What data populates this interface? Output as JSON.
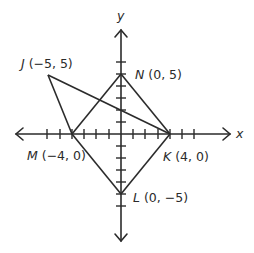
{
  "diagram": {
    "type": "coordinate-plane",
    "colors": {
      "line": "#2b2b2b",
      "background": "#ffffff"
    },
    "axes": {
      "x_label": "x",
      "y_label": "y",
      "tick_spacing_units": 1,
      "x_range": [
        -8,
        8
      ],
      "y_range": [
        -8,
        8
      ]
    },
    "points": [
      {
        "name": "J",
        "coords": "(−5, 5)",
        "x": -5,
        "y": 5
      },
      {
        "name": "N",
        "coords": "(0, 5)",
        "x": 0,
        "y": 5
      },
      {
        "name": "M",
        "coords": "(−4, 0)",
        "x": -4,
        "y": 0
      },
      {
        "name": "K",
        "coords": "(4, 0)",
        "x": 4,
        "y": 0
      },
      {
        "name": "L",
        "coords": "(0, −5)",
        "x": 0,
        "y": -5
      }
    ],
    "segments": [
      [
        "J",
        "M"
      ],
      [
        "J",
        "K"
      ],
      [
        "M",
        "N"
      ],
      [
        "N",
        "K"
      ],
      [
        "K",
        "L"
      ],
      [
        "L",
        "M"
      ]
    ],
    "labels": {
      "J": {
        "letter": "J",
        "coords": " (−5, 5)"
      },
      "N": {
        "letter": "N",
        "coords": " (0, 5)"
      },
      "M": {
        "letter": "M",
        "coords": " (−4, 0)"
      },
      "K": {
        "letter": "K",
        "coords": " (4, 0)"
      },
      "L": {
        "letter": "L",
        "coords": " (0, −5)"
      }
    }
  }
}
